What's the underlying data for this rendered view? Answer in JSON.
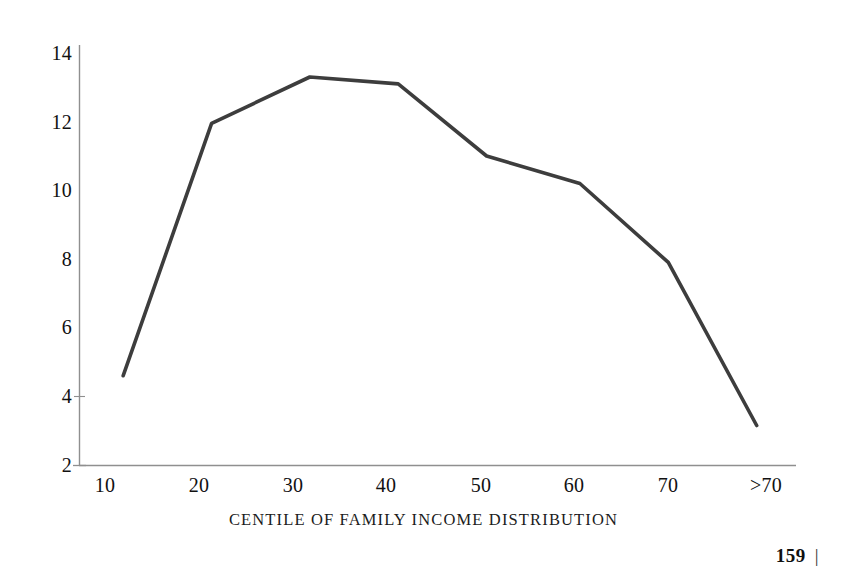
{
  "figure": {
    "background_color": "#ffffff",
    "line_color": "#3d3d3d",
    "axis_color": "#8c8c8c"
  },
  "axes": {
    "y_tick_labels": [
      "14",
      "12",
      "10",
      "8",
      "6",
      "4",
      "2"
    ],
    "x_tick_labels": [
      "10",
      "20",
      "30",
      "40",
      "50",
      "60",
      "70",
      ">70"
    ],
    "x_axis_caption": "CENTILE OF FAMILY INCOME DISTRIBUTION"
  },
  "footer": {
    "page_number": "159",
    "rule_glyph": "|"
  },
  "chart_data": {
    "type": "line",
    "title": "",
    "subtitle": "",
    "xlabel": "CENTILE OF FAMILY INCOME DISTRIBUTION",
    "ylabel": "",
    "categories": [
      "10",
      "20",
      "30",
      "40",
      "50",
      "60",
      "70",
      ">70"
    ],
    "x": [
      11.5,
      20.5,
      30.5,
      39.5,
      48.5,
      58,
      67,
      76
    ],
    "values": [
      4.6,
      11.95,
      13.3,
      13.1,
      11.0,
      10.2,
      7.9,
      3.15
    ],
    "series": [
      {
        "name": "percent of families",
        "values": [
          4.6,
          11.95,
          13.3,
          13.1,
          11.0,
          10.2,
          7.9,
          3.15
        ]
      }
    ],
    "xlim": [
      7,
      80
    ],
    "ylim": [
      2,
      14
    ],
    "y_ticks": [
      2,
      4,
      6,
      8,
      10,
      12,
      14
    ],
    "x_ticks": [
      10,
      20,
      30,
      40,
      50,
      60,
      70,
      76
    ],
    "x_tick_labels": [
      "10",
      "20",
      "30",
      "40",
      "50",
      "60",
      "70",
      ">70"
    ],
    "grid": false,
    "legend": "none",
    "annotations": []
  }
}
